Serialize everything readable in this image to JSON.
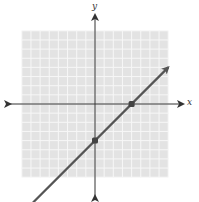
{
  "chart_data": {
    "type": "line",
    "title": "",
    "xlabel": "x",
    "ylabel": "y",
    "xlim": [
      -8,
      8
    ],
    "ylim": [
      -8,
      8
    ],
    "grid": true,
    "grid_step": 1,
    "series": [
      {
        "name": "line",
        "equation": "y = x - 4",
        "slope": 1,
        "intercept": -4,
        "x": [
          -7,
          8
        ],
        "y": [
          -11,
          4
        ]
      }
    ],
    "points": [
      {
        "label": "x-intercept",
        "x": 4,
        "y": 0
      },
      {
        "label": "y-intercept",
        "x": 0,
        "y": -4
      }
    ]
  },
  "labels": {
    "x_axis": "x",
    "y_axis": "y"
  },
  "colors": {
    "grid_bg": "#e3e3e3",
    "grid_line": "#f7f7f7",
    "axis": "#333333",
    "line": "#555555",
    "point": "#444444"
  }
}
